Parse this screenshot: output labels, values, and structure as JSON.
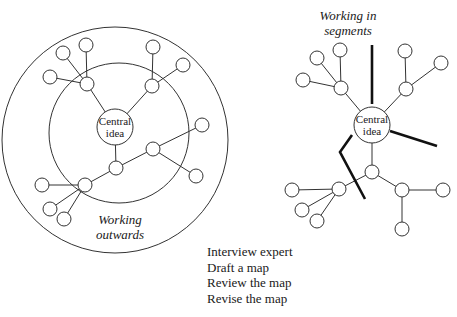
{
  "left_diagram": {
    "title": "Working outwards",
    "title_line1": "Working",
    "title_line2": "outwards",
    "center_label_line1": "Central",
    "center_label_line2": "idea",
    "rings": [
      {
        "name": "outer-ring",
        "cx": 115,
        "cy": 140,
        "r": 113
      },
      {
        "name": "inner-ring",
        "cx": 119,
        "cy": 133,
        "r": 70
      }
    ],
    "center": {
      "x": 115,
      "y": 127,
      "r": 18
    },
    "edges": [
      [
        115,
        127,
        87,
        84
      ],
      [
        87,
        84,
        63,
        53
      ],
      [
        87,
        84,
        86,
        45
      ],
      [
        87,
        84,
        50,
        77
      ],
      [
        115,
        127,
        152,
        86
      ],
      [
        152,
        86,
        153,
        47
      ],
      [
        152,
        86,
        183,
        65
      ],
      [
        115,
        127,
        116,
        168
      ],
      [
        116,
        168,
        153,
        149
      ],
      [
        153,
        149,
        202,
        125
      ],
      [
        153,
        149,
        196,
        176
      ],
      [
        116,
        168,
        85,
        185
      ],
      [
        85,
        185,
        42,
        185
      ],
      [
        85,
        185,
        50,
        209
      ],
      [
        85,
        185,
        64,
        219
      ]
    ],
    "nodes": [
      [
        87,
        84
      ],
      [
        63,
        53
      ],
      [
        86,
        45
      ],
      [
        50,
        77
      ],
      [
        152,
        86
      ],
      [
        153,
        47
      ],
      [
        183,
        65
      ],
      [
        116,
        168
      ],
      [
        153,
        149
      ],
      [
        202,
        125
      ],
      [
        196,
        176
      ],
      [
        85,
        185
      ],
      [
        42,
        185
      ],
      [
        50,
        209
      ],
      [
        64,
        219
      ]
    ]
  },
  "right_diagram": {
    "title_line1": "Working in",
    "title_line2": "segments",
    "center_label_line1": "Central",
    "center_label_line2": "idea",
    "center": {
      "x": 372,
      "y": 125,
      "r": 18
    },
    "edges": [
      [
        372,
        125,
        341,
        88
      ],
      [
        341,
        88,
        317,
        58
      ],
      [
        341,
        88,
        340,
        50
      ],
      [
        341,
        88,
        303,
        80
      ],
      [
        372,
        125,
        406,
        89
      ],
      [
        406,
        89,
        405,
        51
      ],
      [
        406,
        89,
        441,
        63
      ],
      [
        372,
        125,
        372,
        172
      ],
      [
        372,
        172,
        339,
        189
      ],
      [
        339,
        189,
        292,
        190
      ],
      [
        339,
        189,
        302,
        210
      ],
      [
        339,
        189,
        317,
        221
      ],
      [
        372,
        172,
        402,
        190
      ],
      [
        402,
        190,
        443,
        190
      ],
      [
        402,
        190,
        402,
        229
      ]
    ],
    "nodes": [
      [
        341,
        88
      ],
      [
        317,
        58
      ],
      [
        340,
        50
      ],
      [
        303,
        80
      ],
      [
        406,
        89
      ],
      [
        405,
        51
      ],
      [
        441,
        63
      ],
      [
        372,
        172
      ],
      [
        339,
        189
      ],
      [
        292,
        190
      ],
      [
        302,
        210
      ],
      [
        317,
        221
      ],
      [
        402,
        190
      ],
      [
        443,
        190
      ],
      [
        402,
        229
      ]
    ],
    "segment_lines": [
      [
        [
          372,
          45
        ],
        [
          372,
          104
        ]
      ],
      [
        [
          390,
          131
        ],
        [
          437,
          146
        ]
      ],
      [
        [
          352,
          135
        ],
        [
          340,
          152
        ],
        [
          365,
          199
        ]
      ]
    ]
  },
  "steps": [
    "Interview expert",
    "Draft a map",
    "Review the map",
    "Revise the map"
  ],
  "colors": {
    "line": "#333333",
    "background": "#ffffff",
    "segment": "#111111"
  }
}
